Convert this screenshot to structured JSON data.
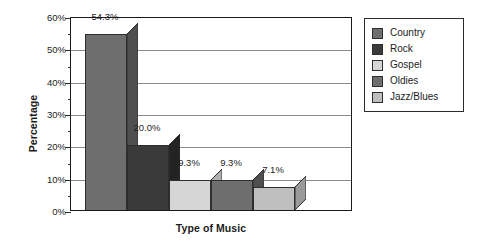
{
  "chart_data": {
    "type": "bar",
    "title": "",
    "subtitle": "",
    "xlabel": "Type of Music",
    "ylabel": "Percentage",
    "categories": [
      "Country",
      "Rock",
      "Gospel",
      "Oldies",
      "Jazz/Blues"
    ],
    "values": [
      54.3,
      20.0,
      9.3,
      9.3,
      7.1
    ],
    "data_labels": [
      "54.3%",
      "20.0%",
      "9.3%",
      "9.3%",
      "7.1%"
    ],
    "ylim": [
      0,
      60
    ],
    "ytick_labels": [
      "0%",
      "10%",
      "20%",
      "30%",
      "40%",
      "50%",
      "60%"
    ],
    "ytick_values": [
      0,
      10,
      20,
      30,
      40,
      50,
      60
    ],
    "yminor_tick_values": [
      5,
      15,
      25,
      35,
      45,
      55
    ],
    "grid": "horizontal",
    "legend_position": "right-outside",
    "series": [
      {
        "name": "Percentage",
        "values": [
          54.3,
          20.0,
          9.3,
          9.3,
          7.1
        ]
      }
    ],
    "colors": {
      "Country": "#6e6e6e",
      "Rock": "#3a3a3a",
      "Gospel": "#d6d6d6",
      "Oldies": "#6e6e6e",
      "Jazz/Blues": "#bfbfbf",
      "Country_side": "#4f4f4f",
      "Rock_side": "#232323",
      "Gospel_side": "#b0b0b0",
      "Oldies_side": "#4f4f4f",
      "Jazz/Blues_side": "#9a9a9a",
      "gridline": "#8b8b8b",
      "axis": "#1a1a1a",
      "background": "#ffffff",
      "text": "#1c1c1c"
    }
  },
  "legend": {
    "items": [
      {
        "label": "Country",
        "swatch": "#6e6e6e"
      },
      {
        "label": "Rock",
        "swatch": "#3a3a3a"
      },
      {
        "label": "Gospel",
        "swatch": "#d6d6d6"
      },
      {
        "label": "Oldies",
        "swatch": "#6e6e6e"
      },
      {
        "label": "Jazz/Blues",
        "swatch": "#bfbfbf"
      }
    ]
  },
  "axes": {
    "y_title": "Percentage",
    "x_title": "Type of Music"
  }
}
